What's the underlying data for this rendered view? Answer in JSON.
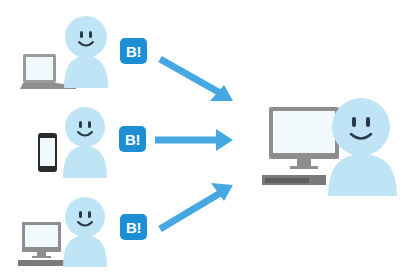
{
  "diagram": {
    "colors": {
      "person": "#BFE4F6",
      "person_face": "#2B3A4A",
      "badge": "#1E8FD5",
      "arrow": "#45A8E3",
      "device_frame": "#8E8E8E",
      "device_screen": "#F2F9FD"
    },
    "senders": [
      {
        "id": "sender-laptop",
        "device": "laptop",
        "badge_label": "B!"
      },
      {
        "id": "sender-smartphone",
        "device": "smartphone",
        "badge_label": "B!"
      },
      {
        "id": "sender-desktop",
        "device": "desktop-computer",
        "badge_label": "B!"
      }
    ],
    "receiver": {
      "id": "receiver-desktop",
      "device": "desktop-computer"
    },
    "arrows": [
      {
        "from": "sender-laptop",
        "to": "receiver-desktop",
        "direction": "down-right"
      },
      {
        "from": "sender-smartphone",
        "to": "receiver-desktop",
        "direction": "right"
      },
      {
        "from": "sender-desktop",
        "to": "receiver-desktop",
        "direction": "up-right"
      }
    ]
  }
}
